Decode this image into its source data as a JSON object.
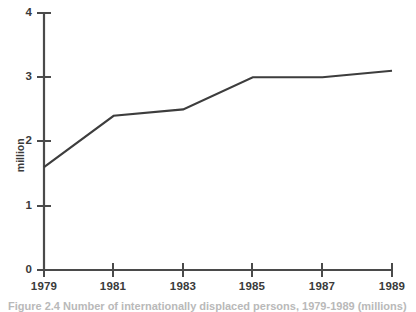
{
  "chart_data": {
    "type": "line",
    "title": "",
    "subtitle": "",
    "xlabel": "",
    "ylabel": "million",
    "x": [
      1979,
      1981,
      1983,
      1985,
      1987,
      1989
    ],
    "categories": [
      "1979",
      "1981",
      "1983",
      "1985",
      "1987",
      "1989"
    ],
    "values": [
      1.6,
      2.4,
      2.5,
      3.0,
      3.0,
      3.1
    ],
    "series": [
      {
        "name": "million",
        "values": [
          1.6,
          2.4,
          2.5,
          3.0,
          3.0,
          3.1
        ]
      }
    ],
    "xlim": [
      1979,
      1989
    ],
    "ylim": [
      0,
      4
    ],
    "xticks": [
      "1979",
      "1981",
      "1983",
      "1985",
      "1987",
      "1989"
    ],
    "yticks": [
      "0",
      "1",
      "2",
      "3",
      "4"
    ],
    "grid": false,
    "legend": false,
    "legend_position": "none",
    "annotations": []
  },
  "axes": {
    "y_title": "million",
    "y_tick_labels": [
      "4",
      "3",
      "2",
      "1",
      "0"
    ],
    "x_tick_labels": [
      "1979",
      "1981",
      "1983",
      "1985",
      "1987",
      "1989"
    ]
  },
  "caption": {
    "text": "Figure 2.4  Number of internationally displaced persons, 1979-1989 (millions)"
  },
  "colors": {
    "line": "#3d3d3d",
    "axis": "#4a4a4a",
    "text": "#3a3a3a",
    "background": "#ffffff",
    "caption": "#b9b9b9"
  }
}
